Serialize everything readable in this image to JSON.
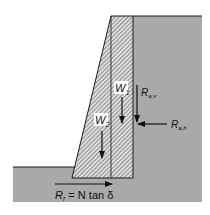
{
  "diagram": {
    "colors": {
      "soil": "#a9a9a9",
      "wall_hatch": "#555555",
      "wall_bg": "#d8d8d8",
      "outline": "#1a1a1a",
      "background": "#ffffff"
    },
    "labels": {
      "w1": "W",
      "w1_sub": "1",
      "w2": "W",
      "w2_sub": "2",
      "rav": "R",
      "rav_sub": "a,v",
      "rah": "R",
      "rah_sub": "a,h",
      "rr": "R",
      "rr_sub": "r",
      "rr_eq": " = N tan δ"
    },
    "forces": [
      {
        "name": "W1",
        "direction": "down"
      },
      {
        "name": "W2",
        "direction": "down"
      },
      {
        "name": "Ra,v",
        "direction": "down"
      },
      {
        "name": "Ra,h",
        "direction": "left"
      },
      {
        "name": "Rr",
        "direction": "right"
      }
    ]
  }
}
